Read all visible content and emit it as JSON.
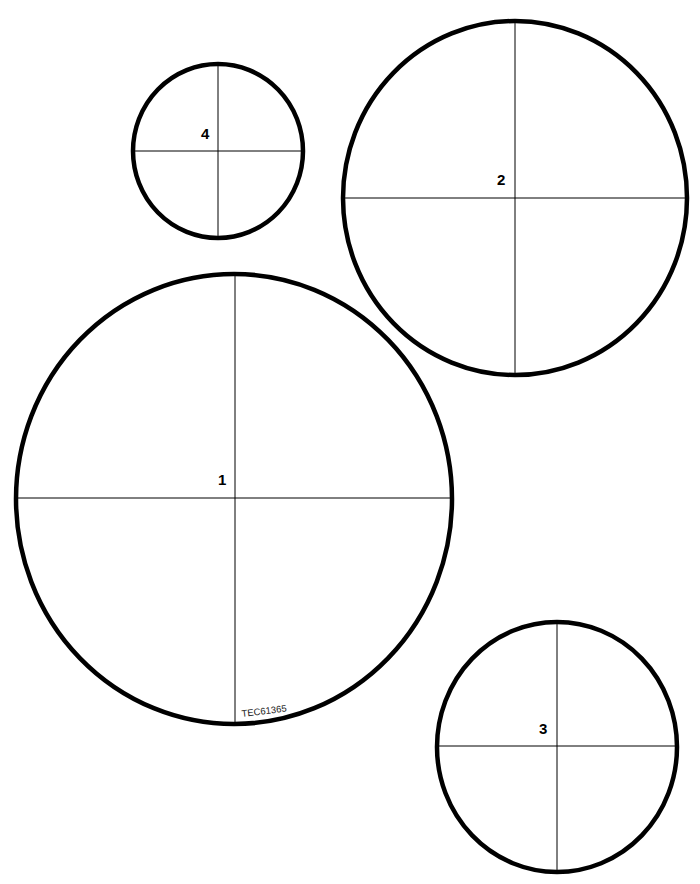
{
  "diagram": {
    "colors": {
      "stroke": "#000000",
      "background": "#ffffff"
    },
    "circles": [
      {
        "label": "1",
        "cx": 234,
        "cy": 499,
        "rx": 218,
        "ry": 225,
        "label_x": 223,
        "label_y": 485
      },
      {
        "label": "2",
        "cx": 515,
        "cy": 198,
        "rx": 172,
        "ry": 177,
        "label_x": 502,
        "label_y": 185
      },
      {
        "label": "3",
        "cx": 557,
        "cy": 746,
        "rx": 120,
        "ry": 125,
        "label_x": 543,
        "label_y": 734
      },
      {
        "label": "4",
        "cx": 218,
        "cy": 151,
        "rx": 85,
        "ry": 87,
        "label_x": 206,
        "label_y": 138
      }
    ],
    "reference_code": "TEC61365"
  }
}
